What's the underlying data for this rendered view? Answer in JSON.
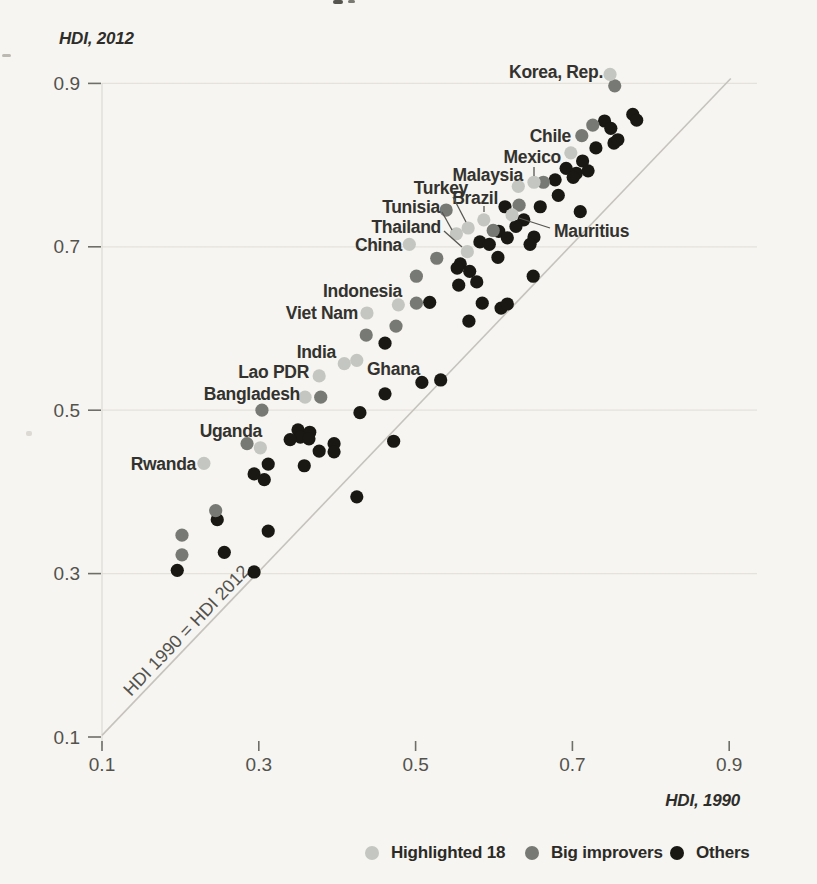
{
  "figure": {
    "y_axis_title": "HDI, 2012",
    "x_axis_title": "HDI, 1990"
  },
  "legend": [
    {
      "label": "Highlighted 18",
      "color": "#c4c6c2"
    },
    {
      "label": "Big improvers",
      "color": "#777975"
    },
    {
      "label": "Others",
      "color": "#191813"
    }
  ],
  "chart_data": {
    "type": "scatter",
    "xlabel": "HDI, 1990",
    "ylabel": "HDI, 2012",
    "xlim": [
      0.1,
      0.935
    ],
    "ylim": [
      0.1,
      0.935
    ],
    "x_ticks": [
      "0.1",
      "0.3",
      "0.5",
      "0.7",
      "0.9"
    ],
    "y_ticks": [
      "0.1",
      "0.3",
      "0.5",
      "0.7",
      "0.9"
    ],
    "x_tick_values": [
      0.1,
      0.3,
      0.5,
      0.7,
      0.9
    ],
    "y_tick_values": [
      0.1,
      0.3,
      0.5,
      0.7,
      0.9
    ],
    "gridline_ys": [
      0.3,
      0.5,
      0.7,
      0.9
    ],
    "grid": true,
    "legend_position": "bottom",
    "identity_line": {
      "x1": 0.1,
      "y1": 0.102,
      "x2": 0.902,
      "y2": 0.906,
      "label": "HDI 1990 = HDI 2012"
    },
    "series": [
      {
        "name": "Others",
        "color": "#191813",
        "points": [
          [
            0.741,
            0.854
          ],
          [
            0.749,
            0.845
          ],
          [
            0.777,
            0.862
          ],
          [
            0.782,
            0.855
          ],
          [
            0.73,
            0.821
          ],
          [
            0.753,
            0.827
          ],
          [
            0.758,
            0.831
          ],
          [
            0.713,
            0.805
          ],
          [
            0.692,
            0.796
          ],
          [
            0.705,
            0.79
          ],
          [
            0.72,
            0.793
          ],
          [
            0.701,
            0.785
          ],
          [
            0.678,
            0.782
          ],
          [
            0.682,
            0.763
          ],
          [
            0.71,
            0.743
          ],
          [
            0.659,
            0.749
          ],
          [
            0.614,
            0.749
          ],
          [
            0.638,
            0.733
          ],
          [
            0.628,
            0.725
          ],
          [
            0.606,
            0.719
          ],
          [
            0.617,
            0.711
          ],
          [
            0.651,
            0.712
          ],
          [
            0.646,
            0.703
          ],
          [
            0.582,
            0.706
          ],
          [
            0.594,
            0.703
          ],
          [
            0.605,
            0.687
          ],
          [
            0.557,
            0.679
          ],
          [
            0.553,
            0.674
          ],
          [
            0.569,
            0.67
          ],
          [
            0.555,
            0.653
          ],
          [
            0.578,
            0.657
          ],
          [
            0.65,
            0.664
          ],
          [
            0.518,
            0.632
          ],
          [
            0.585,
            0.631
          ],
          [
            0.609,
            0.625
          ],
          [
            0.617,
            0.63
          ],
          [
            0.568,
            0.609
          ],
          [
            0.461,
            0.582
          ],
          [
            0.508,
            0.534
          ],
          [
            0.532,
            0.537
          ],
          [
            0.461,
            0.52
          ],
          [
            0.429,
            0.497
          ],
          [
            0.472,
            0.462
          ],
          [
            0.425,
            0.394
          ],
          [
            0.35,
            0.476
          ],
          [
            0.365,
            0.473
          ],
          [
            0.353,
            0.467
          ],
          [
            0.364,
            0.465
          ],
          [
            0.34,
            0.464
          ],
          [
            0.396,
            0.459
          ],
          [
            0.377,
            0.45
          ],
          [
            0.396,
            0.449
          ],
          [
            0.358,
            0.432
          ],
          [
            0.312,
            0.434
          ],
          [
            0.294,
            0.422
          ],
          [
            0.307,
            0.415
          ],
          [
            0.247,
            0.366
          ],
          [
            0.312,
            0.352
          ],
          [
            0.256,
            0.326
          ],
          [
            0.196,
            0.304
          ],
          [
            0.294,
            0.302
          ]
        ]
      },
      {
        "name": "Big improvers",
        "color": "#777975",
        "points": [
          [
            0.754,
            0.897
          ],
          [
            0.726,
            0.849
          ],
          [
            0.712,
            0.836
          ],
          [
            0.663,
            0.779
          ],
          [
            0.632,
            0.751
          ],
          [
            0.599,
            0.72
          ],
          [
            0.539,
            0.745
          ],
          [
            0.527,
            0.686
          ],
          [
            0.501,
            0.664
          ],
          [
            0.501,
            0.631
          ],
          [
            0.475,
            0.603
          ],
          [
            0.437,
            0.592
          ],
          [
            0.379,
            0.516
          ],
          [
            0.304,
            0.5
          ],
          [
            0.285,
            0.459
          ],
          [
            0.245,
            0.377
          ],
          [
            0.202,
            0.347
          ],
          [
            0.202,
            0.323
          ]
        ]
      },
      {
        "name": "Highlighted 18",
        "color": "#c4c6c2",
        "points": [
          {
            "label": "Korea, Rep.",
            "x": 0.748,
            "y": 0.911,
            "label_px": [
              603,
              72
            ],
            "align": "end"
          },
          {
            "label": "Chile",
            "x": 0.698,
            "y": 0.815,
            "label_px": [
              571,
              136
            ],
            "align": "end"
          },
          {
            "label": "Mexico",
            "x": 0.651,
            "y": 0.779,
            "label_px": [
              561,
              157
            ],
            "align": "end",
            "leader": [
              534,
              167,
              534,
              176
            ]
          },
          {
            "label": "Malaysia",
            "x": 0.631,
            "y": 0.774,
            "label_px": [
              523,
              175
            ],
            "align": "end"
          },
          {
            "label": "Brazil",
            "x": 0.587,
            "y": 0.733,
            "label_px": [
              498,
              198
            ],
            "align": "end",
            "leader": [
              484,
              206,
              484,
              212
            ]
          },
          {
            "label": "Turkey",
            "x": 0.567,
            "y": 0.723,
            "label_px": [
              468,
              188
            ],
            "align": "end",
            "leader": [
              453,
              197,
              466,
              222
            ]
          },
          {
            "label": "Tunisia",
            "x": 0.552,
            "y": 0.716,
            "label_px": [
              440,
              207
            ],
            "align": "end",
            "leader": [
              442,
              212,
              452,
              230
            ]
          },
          {
            "label": "Thailand",
            "x": 0.566,
            "y": 0.694,
            "label_px": [
              441,
              227
            ],
            "align": "end",
            "leader": [
              444,
              231,
              462,
              247
            ]
          },
          {
            "label": "China",
            "x": 0.492,
            "y": 0.703,
            "label_px": [
              402,
              245
            ],
            "align": "end"
          },
          {
            "label": "Mauritius",
            "x": 0.623,
            "y": 0.739,
            "label_px": [
              554,
              231
            ],
            "align": "start",
            "leader": [
              550,
              228,
              519,
              218
            ]
          },
          {
            "label": "Indonesia",
            "x": 0.478,
            "y": 0.629,
            "label_px": [
              402,
              291
            ],
            "align": "end"
          },
          {
            "label": "Viet Nam",
            "x": 0.438,
            "y": 0.619,
            "label_px": [
              358,
              313
            ],
            "align": "end"
          },
          {
            "label": "India",
            "x": 0.409,
            "y": 0.557,
            "label_px": [
              336,
              352
            ],
            "align": "end"
          },
          {
            "label": "Ghana",
            "x": 0.425,
            "y": 0.561,
            "label_px": [
              367,
              369
            ],
            "align": "start"
          },
          {
            "label": "Lao PDR",
            "x": 0.377,
            "y": 0.542,
            "label_px": [
              309,
              372
            ],
            "align": "end"
          },
          {
            "label": "Bangladesh",
            "x": 0.359,
            "y": 0.516,
            "label_px": [
              300,
              394
            ],
            "align": "end"
          },
          {
            "label": "Uganda",
            "x": 0.302,
            "y": 0.454,
            "label_px": [
              262,
              431
            ],
            "align": "end"
          },
          {
            "label": "Rwanda",
            "x": 0.23,
            "y": 0.435,
            "label_px": [
              196,
              464
            ],
            "align": "end"
          }
        ]
      }
    ]
  },
  "artifacts": [
    {
      "x": 333,
      "y": 0,
      "w": 10,
      "h": 4,
      "c": "#55544e"
    },
    {
      "x": 348,
      "y": 0,
      "w": 7,
      "h": 3,
      "c": "#7a7972"
    },
    {
      "x": 2,
      "y": 54,
      "w": 9,
      "h": 3,
      "c": "#bcb9b2"
    },
    {
      "x": 26,
      "y": 431,
      "w": 6,
      "h": 5,
      "c": "#dcd9d2"
    }
  ]
}
